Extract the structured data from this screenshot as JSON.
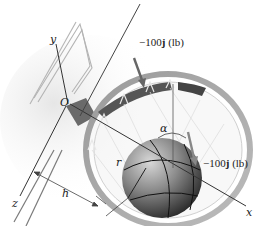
{
  "figure": {
    "axes": {
      "x": "x",
      "y": "y",
      "z": "z",
      "origin": "O"
    },
    "forces": [
      {
        "label": "−100",
        "unit_vector": "j",
        "units": "(lb)",
        "location": "rim top"
      },
      {
        "label": "−100",
        "unit_vector": "j",
        "units": "(lb)",
        "location": "rim right"
      }
    ],
    "dimensions": {
      "h": "h",
      "r": "r",
      "alpha": "α"
    },
    "colors": {
      "rim": "#8a8a8a",
      "arrow": "#666666",
      "ball_dark": "#2a2a2a",
      "ball_light": "#bdbdbd",
      "line": "#333333"
    }
  }
}
